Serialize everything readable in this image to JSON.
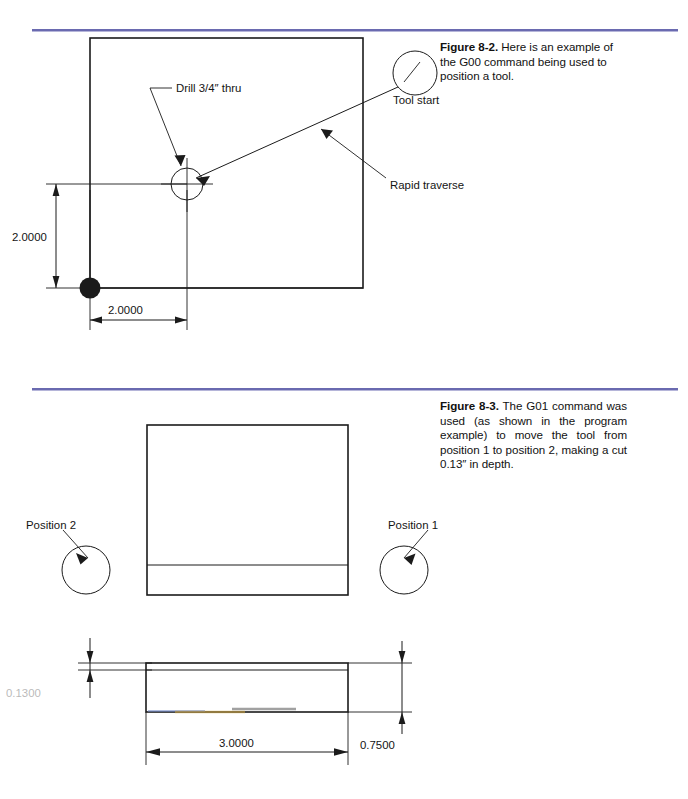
{
  "page": {
    "background": "#ffffff",
    "rule_color": "#6a6ab0",
    "line_color": "#1b1b1b"
  },
  "figures": [
    {
      "id": "figure-8-2",
      "number": "Figure 8-2.",
      "caption_text": "Here is an example of the G00 command being used to position a tool.",
      "labels": {
        "drill": "Drill 3/4″ thru",
        "tool_start": "Tool start",
        "rapid_traverse": "Rapid traverse"
      },
      "dimensions": {
        "vertical": "2.0000",
        "horizontal": "2.0000"
      }
    },
    {
      "id": "figure-8-3",
      "number": "Figure 8-3.",
      "caption_text": "The G01 command was used (as shown in the program example) to move the tool from position 1 to position 2, making a cut 0.13″ in depth.",
      "labels": {
        "position_2": "Position 2",
        "position_1": "Position 1"
      },
      "dimensions": {
        "depth_of_cut": "0.1300",
        "length": "3.0000",
        "thickness": "0.7500"
      }
    }
  ]
}
